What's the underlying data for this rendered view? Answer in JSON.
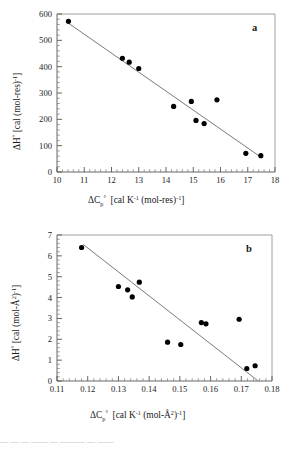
{
  "figure": {
    "background": "#ffffff",
    "point_color": "#000000",
    "line_color": "#7a7a7a",
    "axis_color": "#555555",
    "caption_fragment": "—  —   —  ——   —  ———   —  ——"
  },
  "chart_data": [
    {
      "type": "scatter",
      "panel_label": "a",
      "title": "",
      "xlabel": "ΔC_p°  [cal K⁻¹ (mol-res)⁻¹]",
      "ylabel": "ΔH°  [cal (mol-res)⁻¹]",
      "xlim": [
        10,
        18
      ],
      "ylim": [
        0,
        600
      ],
      "xticks": [
        10,
        11,
        12,
        13,
        14,
        15,
        16,
        17,
        18
      ],
      "yticks": [
        0,
        100,
        200,
        300,
        400,
        500,
        600
      ],
      "xtick_labels": [
        "10",
        "11",
        "12",
        "13",
        "14",
        "15",
        "16",
        "17",
        "18"
      ],
      "ytick_labels": [
        "0",
        "100",
        "200",
        "300",
        "400",
        "500",
        "600"
      ],
      "minor_ticks_per_interval": 5,
      "grid": false,
      "legend": "none",
      "x": [
        10.42,
        12.4,
        12.65,
        13.0,
        14.28,
        14.93,
        15.1,
        15.4,
        15.87,
        16.93,
        17.48
      ],
      "y": [
        572,
        432,
        417,
        393,
        249,
        268,
        196,
        184,
        274,
        71,
        62
      ],
      "fit_line": {
        "x_start": 10.42,
        "y_start": 565,
        "x_end": 17.5,
        "y_end": 55
      }
    },
    {
      "type": "scatter",
      "panel_label": "b",
      "title": "",
      "xlabel": "ΔC_p°  [cal K⁻¹ (mol-Å²)⁻¹]",
      "ylabel": "ΔH°  [cal (mol-Å²)⁻¹]",
      "xlim": [
        0.11,
        0.18
      ],
      "ylim": [
        0,
        7
      ],
      "xticks": [
        0.11,
        0.12,
        0.13,
        0.14,
        0.15,
        0.16,
        0.17,
        0.18
      ],
      "yticks": [
        0,
        1,
        2,
        3,
        4,
        5,
        6,
        7
      ],
      "xtick_labels": [
        "0.11",
        "0.12",
        "0.13",
        "0.14",
        "0.15",
        "0.16",
        "0.17",
        "0.18"
      ],
      "ytick_labels": [
        "0",
        "1",
        "2",
        "3",
        "4",
        "5",
        "6",
        "7"
      ],
      "minor_ticks_per_interval": 5,
      "grid": false,
      "legend": "none",
      "x": [
        0.118,
        0.13,
        0.133,
        0.1345,
        0.1368,
        0.146,
        0.1503,
        0.157,
        0.1585,
        0.1693,
        0.1718,
        0.1745
      ],
      "y": [
        6.4,
        4.53,
        4.37,
        4.03,
        4.74,
        1.86,
        1.75,
        2.8,
        2.74,
        2.96,
        0.6,
        0.73
      ],
      "fit_line": {
        "x_start": 0.1185,
        "y_start": 6.55,
        "x_end": 0.1755,
        "y_end": 0.0
      }
    }
  ],
  "labels": {
    "panel_a_tag": "a",
    "panel_b_tag": "b",
    "delta": "Δ",
    "degree": "°",
    "H": "H",
    "C": "C",
    "p_sub": "p",
    "bracket_open": "[",
    "bracket_close": "]",
    "cal": "cal",
    "K": "K",
    "inv_one": "-1",
    "mol_res": "(mol-res)",
    "mol_area": "(mol-Å",
    "area_exp": "2",
    "mol_area_close": ")"
  }
}
